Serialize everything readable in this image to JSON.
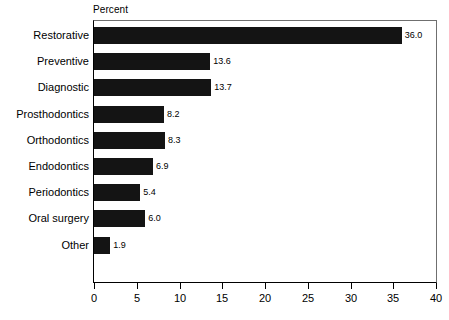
{
  "chart_data": {
    "type": "bar",
    "orientation": "horizontal",
    "title": "",
    "xlabel": "Percent",
    "ylabel": "",
    "xlim": [
      0,
      40
    ],
    "xticks": [
      0,
      5,
      10,
      15,
      20,
      25,
      30,
      35,
      40
    ],
    "xtick_labels": [
      "0",
      "5",
      "10",
      "15",
      "20",
      "25",
      "30",
      "35",
      "40"
    ],
    "grid": false,
    "legend": false,
    "bar_color": "#141414",
    "categories": [
      "Restorative",
      "Preventive",
      "Diagnostic",
      "Prosthodontics",
      "Orthodontics",
      "Endodontics",
      "Periodontics",
      "Oral surgery",
      "Other"
    ],
    "values": [
      36.0,
      13.6,
      13.7,
      8.2,
      8.3,
      6.9,
      5.4,
      6.0,
      1.9
    ],
    "value_labels": [
      "36.0",
      "13.6",
      "13.7",
      "8.2",
      "8.3",
      "6.9",
      "5.4",
      "6.0",
      "1.9"
    ],
    "bars": [
      {
        "category": "Restorative",
        "value": 36.0,
        "label": "36.0"
      },
      {
        "category": "Preventive",
        "value": 13.6,
        "label": "13.6"
      },
      {
        "category": "Diagnostic",
        "value": 13.7,
        "label": "13.7"
      },
      {
        "category": "Prosthodontics",
        "value": 8.2,
        "label": "8.2"
      },
      {
        "category": "Orthodontics",
        "value": 8.3,
        "label": "8.3"
      },
      {
        "category": "Endodontics",
        "value": 6.9,
        "label": "6.9"
      },
      {
        "category": "Periodontics",
        "value": 5.4,
        "label": "5.4"
      },
      {
        "category": "Oral surgery",
        "value": 6.0,
        "label": "6.0"
      },
      {
        "category": "Other",
        "value": 1.9,
        "label": "1.9"
      }
    ]
  }
}
